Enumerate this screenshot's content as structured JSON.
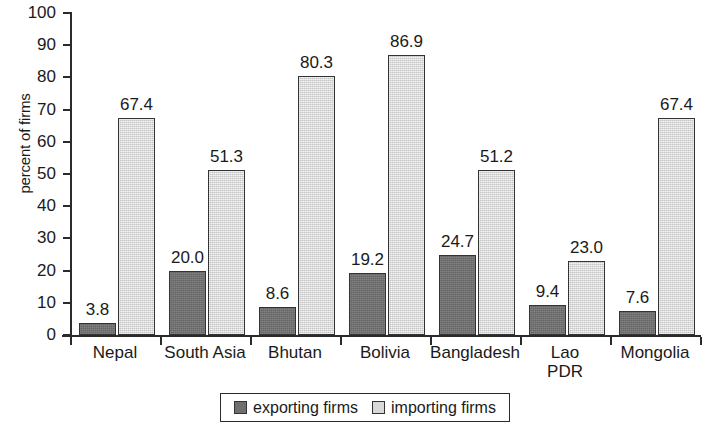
{
  "chart_data": {
    "type": "bar",
    "title": "",
    "xlabel": "",
    "ylabel": "percent of firms",
    "ylim": [
      0,
      100
    ],
    "yticks": [
      0,
      10,
      20,
      30,
      40,
      50,
      60,
      70,
      80,
      90,
      100
    ],
    "grid": false,
    "legend_position": "bottom",
    "categories": [
      "Nepal",
      "South Asia",
      "Bhutan",
      "Bolivia",
      "Bangladesh",
      "Lao PDR",
      "Mongolia"
    ],
    "series": [
      {
        "name": "exporting firms",
        "color": "#6f6f6f",
        "values": [
          3.8,
          20.0,
          8.6,
          19.2,
          24.7,
          9.4,
          7.6
        ],
        "labels": [
          "3.8",
          "20.0",
          "8.6",
          "19.2",
          "24.7",
          "9.4",
          "7.6"
        ]
      },
      {
        "name": "importing firms",
        "color": "#d8d8d8",
        "values": [
          67.4,
          51.3,
          80.3,
          86.9,
          51.2,
          23.0,
          67.4
        ],
        "labels": [
          "67.4",
          "51.3",
          "80.3",
          "86.9",
          "51.2",
          "23.0",
          "67.4"
        ]
      }
    ]
  },
  "axis": {
    "y_title": "percent of firms",
    "y_tick_labels": [
      "100",
      "90",
      "80",
      "70",
      "60",
      "50",
      "40",
      "30",
      "20",
      "10",
      "0"
    ]
  },
  "x_labels": [
    {
      "line1": "Nepal",
      "line2": ""
    },
    {
      "line1": "South Asia",
      "line2": ""
    },
    {
      "line1": "Bhutan",
      "line2": ""
    },
    {
      "line1": "Bolivia",
      "line2": ""
    },
    {
      "line1": "Bangladesh",
      "line2": ""
    },
    {
      "line1": "Lao",
      "line2": "PDR"
    },
    {
      "line1": "Mongolia",
      "line2": ""
    }
  ],
  "legend": {
    "items": [
      {
        "label": "exporting firms",
        "swatch": "exporting"
      },
      {
        "label": "importing firms",
        "swatch": "importing"
      }
    ]
  }
}
